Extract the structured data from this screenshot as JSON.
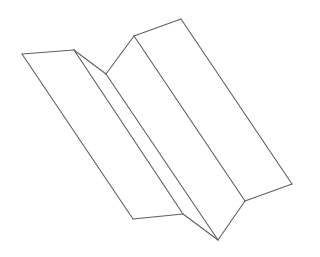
{
  "diagram": {
    "stroke_color": "#5f5f5f",
    "background_color": "#ffffff",
    "vertices": {
      "A": [
        22,
        54
      ],
      "B": [
        74,
        50
      ],
      "C": [
        106,
        74
      ],
      "D": [
        134,
        36
      ],
      "E": [
        181,
        19
      ],
      "F": [
        133,
        219
      ],
      "G": [
        183,
        214
      ],
      "H": [
        218,
        240
      ],
      "I": [
        245,
        201
      ],
      "J": [
        292,
        184
      ]
    },
    "panels": [
      {
        "name": "left-panel",
        "points": "22,54 74,50 183,214 133,219"
      },
      {
        "name": "valley-left-panel",
        "points": "74,50 106,74 218,240 183,214"
      },
      {
        "name": "valley-right-panel",
        "points": "106,74 134,36 245,201 218,240"
      },
      {
        "name": "right-panel",
        "points": "134,36 181,19 292,184 245,201"
      }
    ],
    "edges": [
      {
        "name": "top-edge-left",
        "from": [
          22,
          54
        ],
        "to": [
          74,
          50
        ]
      },
      {
        "name": "left-outer-edge",
        "from": [
          22,
          54
        ],
        "to": [
          133,
          219
        ]
      },
      {
        "name": "bottom-edge-left",
        "from": [
          133,
          219
        ],
        "to": [
          183,
          214
        ]
      },
      {
        "name": "fold-line-1",
        "from": [
          74,
          50
        ],
        "to": [
          183,
          214
        ]
      },
      {
        "name": "top-edge-valley-left",
        "from": [
          74,
          50
        ],
        "to": [
          106,
          74
        ]
      },
      {
        "name": "valley-fold-line",
        "from": [
          106,
          74
        ],
        "to": [
          218,
          240
        ]
      },
      {
        "name": "top-edge-valley-right",
        "from": [
          106,
          74
        ],
        "to": [
          134,
          36
        ]
      },
      {
        "name": "mountain-fold-line",
        "from": [
          134,
          36
        ],
        "to": [
          245,
          201
        ]
      },
      {
        "name": "top-edge-right",
        "from": [
          134,
          36
        ],
        "to": [
          181,
          19
        ]
      },
      {
        "name": "right-outer-edge",
        "from": [
          181,
          19
        ],
        "to": [
          292,
          184
        ]
      },
      {
        "name": "bottom-edge-right",
        "from": [
          292,
          184
        ],
        "to": [
          245,
          201
        ]
      },
      {
        "name": "bottom-edge-valley-right",
        "from": [
          245,
          201
        ],
        "to": [
          218,
          240
        ]
      },
      {
        "name": "bottom-edge-valley-left",
        "from": [
          183,
          214
        ],
        "to": [
          218,
          240
        ]
      }
    ]
  }
}
